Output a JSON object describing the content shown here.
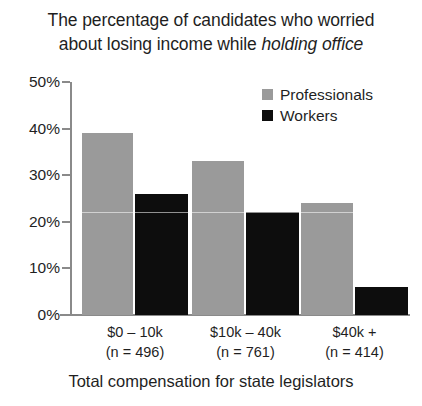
{
  "chart_data": {
    "type": "bar",
    "title": "The percentage of candidates who worried about losing income while holding office",
    "title_line1": "The percentage of candidates who worried",
    "title_line2_plain": "about losing income while ",
    "title_line2_italic": "holding office",
    "xlabel": "Total compensation for state legislators",
    "ylabel": "",
    "ylim": [
      0,
      50
    ],
    "ytick_labels": [
      "50%",
      "40%",
      "30%",
      "20%",
      "10%",
      "0%"
    ],
    "ytick_values": [
      50,
      40,
      30,
      20,
      10,
      0
    ],
    "grid": false,
    "legend_position": "top-right",
    "categories": [
      "$0 – 10k",
      "$10k – 40k",
      "$40k +"
    ],
    "category_counts": [
      "(n = 496)",
      "(n = 761)",
      "(n = 414)"
    ],
    "series": [
      {
        "name": "Professionals",
        "color": "#9a9a9a",
        "values": [
          39,
          33,
          24
        ]
      },
      {
        "name": "Workers",
        "color": "#0d0d0d",
        "values": [
          26,
          22,
          6
        ]
      }
    ]
  },
  "colors": {
    "professionals": "#9a9a9a",
    "workers": "#0d0d0d",
    "axis": "#8a8a8a",
    "text": "#1f1f1f",
    "background": "#ffffff"
  }
}
